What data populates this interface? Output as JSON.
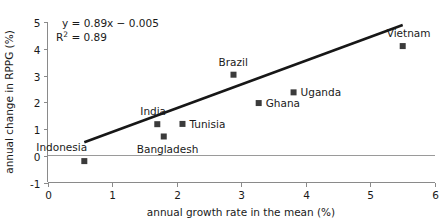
{
  "chart_data": {
    "type": "scatter",
    "title": "",
    "xlabel": "annual growth rate in the mean (%)",
    "ylabel": "annual change in RPPG (%)",
    "xlim": [
      0,
      6
    ],
    "ylim": [
      -1,
      5
    ],
    "xticks": [
      0,
      1,
      2,
      3,
      4,
      5,
      6
    ],
    "yticks": [
      -1,
      0,
      1,
      2,
      3,
      4,
      5
    ],
    "xtick_labels": [
      "0",
      "1",
      "2",
      "3",
      "4",
      "5",
      "6"
    ],
    "ytick_labels": [
      "-1",
      "0",
      "1",
      "2",
      "3",
      "4",
      "5"
    ],
    "grid": "zero-line-only",
    "legend": "none",
    "annotations": {
      "equation": "y = 0.89x − 0.005",
      "r_squared_prefix": "R",
      "r_squared_sup": "2",
      "r_squared_value": " = 0.89"
    },
    "trend_line": {
      "slope": 0.89,
      "intercept": -0.005,
      "x_start": 0.57,
      "x_end": 5.5
    },
    "points": [
      {
        "label": "Indonesia",
        "x": 0.57,
        "y": -0.2,
        "label_dx": -48,
        "label_dy": -10
      },
      {
        "label": "India",
        "x": 1.7,
        "y": 1.18,
        "label_dx": -17,
        "label_dy": -9
      },
      {
        "label": "Bangladesh",
        "x": 1.8,
        "y": 0.72,
        "label_dx": -27,
        "label_dy": 17
      },
      {
        "label": "Tunisia",
        "x": 2.09,
        "y": 1.19,
        "label_dx": 7,
        "label_dy": 4
      },
      {
        "label": "Brazil",
        "x": 2.88,
        "y": 3.03,
        "label_dx": -15,
        "label_dy": -9
      },
      {
        "label": "Ghana",
        "x": 3.27,
        "y": 1.97,
        "label_dx": 7,
        "label_dy": 4
      },
      {
        "label": "Uganda",
        "x": 3.81,
        "y": 2.37,
        "label_dx": 7,
        "label_dy": 4
      },
      {
        "label": "Vietnam",
        "x": 5.5,
        "y": 4.1,
        "label_dx": -16,
        "label_dy": -9
      }
    ]
  }
}
